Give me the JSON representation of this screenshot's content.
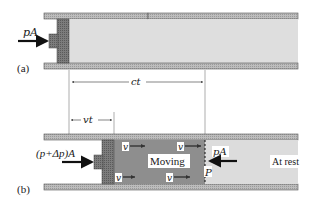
{
  "diagram": {
    "panel_a": {
      "label": "(a)",
      "force_label": "pA"
    },
    "dimensions": {
      "ct_label": "ct",
      "vt_label": "vt"
    },
    "panel_b": {
      "label": "(b)",
      "force_left_label": "(p+Δp)A",
      "force_right_label": "pA",
      "moving_label": "Moving",
      "rest_label": "At rest",
      "point_label": "P",
      "velocity_label": "v"
    },
    "colors": {
      "wall": "#c9c9c9",
      "wall_edge": "#555555",
      "fluid_rest": "#dcdcdc",
      "fluid_moving": "#8e8e8e",
      "piston": "#7a7a7a",
      "line": "#222222"
    }
  }
}
